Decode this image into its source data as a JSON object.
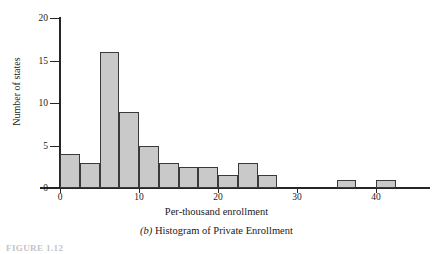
{
  "chart_data": {
    "type": "bar",
    "title": "",
    "caption_prefix": "(b)",
    "caption": "Histogram of Private Enrollment",
    "xlabel": "Per-thousand enrollment",
    "ylabel": "Number of states",
    "xlim": [
      -2.5,
      46
    ],
    "ylim": [
      0,
      20
    ],
    "xticks": [
      0,
      10,
      20,
      30,
      40
    ],
    "yticks": [
      0,
      5,
      10,
      15,
      20
    ],
    "xtick_labels": [
      "0",
      "10",
      "20",
      "30",
      "40"
    ],
    "ytick_labels": [
      "0",
      "5",
      "10",
      "15",
      "20"
    ],
    "grid": false,
    "legend": "none",
    "bin_width": 2.5,
    "bins": [
      {
        "x0": 0.0,
        "x1": 2.5,
        "value": 4
      },
      {
        "x0": 2.5,
        "x1": 5.0,
        "value": 3
      },
      {
        "x0": 5.0,
        "x1": 7.5,
        "value": 16
      },
      {
        "x0": 7.5,
        "x1": 10.0,
        "value": 9
      },
      {
        "x0": 10.0,
        "x1": 12.5,
        "value": 5
      },
      {
        "x0": 12.5,
        "x1": 15.0,
        "value": 3
      },
      {
        "x0": 15.0,
        "x1": 17.5,
        "value": 2.5
      },
      {
        "x0": 17.5,
        "x1": 20.0,
        "value": 2.5
      },
      {
        "x0": 20.0,
        "x1": 22.5,
        "value": 1.5
      },
      {
        "x0": 22.5,
        "x1": 25.0,
        "value": 3
      },
      {
        "x0": 25.0,
        "x1": 27.5,
        "value": 1.5
      },
      {
        "x0": 35.0,
        "x1": 37.5,
        "value": 1
      },
      {
        "x0": 40.0,
        "x1": 42.5,
        "value": 1
      }
    ],
    "categories": [
      "0-2.5",
      "2.5-5",
      "5-7.5",
      "7.5-10",
      "10-12.5",
      "12.5-15",
      "15-17.5",
      "17.5-20",
      "20-22.5",
      "22.5-25",
      "25-27.5",
      "35-37.5",
      "40-42.5"
    ],
    "values": [
      4,
      3,
      16,
      9,
      5,
      3,
      2.5,
      2.5,
      1.5,
      3,
      1.5,
      1,
      1
    ],
    "colors": {
      "bar_fill": "#c9c9c9",
      "bar_stroke": "#3a3a3a",
      "axis": "#262626",
      "text": "#1a1a1a"
    }
  },
  "figure_number": "FIGURE 1.12"
}
